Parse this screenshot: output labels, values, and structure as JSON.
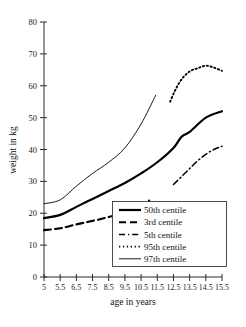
{
  "chart_data": {
    "type": "line",
    "title": "",
    "xlabel": "age in years",
    "ylabel": "weight in kg",
    "xlim": [
      5,
      15.5
    ],
    "ylim": [
      0,
      80
    ],
    "grid": false,
    "legend_position": "inside-bottom-right",
    "x_ticks": [
      "5",
      "5.5",
      "6.5",
      "7.5",
      "8.5",
      "9.5",
      "10.5",
      "11.5",
      "12.5",
      "13.5",
      "14.5",
      "15.5"
    ],
    "x_tick_values": [
      5,
      5.5,
      6.5,
      7.5,
      8.5,
      9.5,
      10.5,
      11.5,
      12.5,
      13.5,
      14.5,
      15.5
    ],
    "y_ticks": [
      "0",
      "10",
      "20",
      "30",
      "40",
      "50",
      "60",
      "70",
      "80"
    ],
    "y_tick_values": [
      0,
      10,
      20,
      30,
      40,
      50,
      60,
      70,
      80
    ],
    "series": [
      {
        "name": "50th centile",
        "style": "solid-thick",
        "color": "#000000",
        "x": [
          5,
          5.5,
          6.5,
          7.5,
          8.5,
          9.5,
          10.5,
          11.5,
          12.5,
          13,
          13.5,
          14.5,
          15.5
        ],
        "y": [
          18.5,
          19.5,
          22,
          24.5,
          27,
          29.5,
          32.5,
          36,
          40.5,
          44,
          45.5,
          50,
          52
        ]
      },
      {
        "name": "3rd centile",
        "style": "dashed",
        "color": "#000000",
        "x": [
          5,
          5.5,
          6.5,
          7.5,
          8.5,
          9.5,
          10.5,
          11
        ],
        "y": [
          14.7,
          15.3,
          16.5,
          17.6,
          18.8,
          20.2,
          22,
          24
        ]
      },
      {
        "name": "5th centile",
        "style": "dash-dot",
        "color": "#000000",
        "x": [
          12.5,
          13,
          13.5,
          14,
          14.5,
          15,
          15.5
        ],
        "y": [
          29,
          31.5,
          34,
          36.5,
          38.5,
          40,
          41
        ]
      },
      {
        "name": "95th centile",
        "style": "dotted",
        "color": "#000000",
        "x": [
          12.3,
          12.6,
          13,
          13.5,
          14,
          14.5,
          15,
          15.5
        ],
        "y": [
          55,
          58.5,
          62,
          64.5,
          65.5,
          66.3,
          65.7,
          64.7
        ]
      },
      {
        "name": "97th centile",
        "style": "solid-thin",
        "color": "#000000",
        "x": [
          5,
          5.5,
          6.5,
          7.5,
          8.5,
          9.5,
          10.5,
          11.4
        ],
        "y": [
          23,
          24.2,
          28.5,
          32.5,
          36,
          40.5,
          48,
          57
        ]
      }
    ]
  },
  "legend": {
    "entries": [
      {
        "label": "50th centile"
      },
      {
        "label": "3rd centile"
      },
      {
        "label": "5th centile"
      },
      {
        "label": "95th centile"
      },
      {
        "label": "97th centile"
      }
    ]
  }
}
